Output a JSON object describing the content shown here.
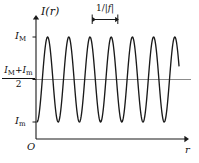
{
  "figure": {
    "axes": {
      "y_label": "I(r)",
      "x_label": "r",
      "origin_label": "O"
    },
    "tick_labels": {
      "max": {
        "symbol": "I",
        "subscript": "M"
      },
      "min": {
        "symbol": "I",
        "subscript": "m"
      },
      "mean": {
        "numerator_first": "I",
        "numerator_first_sub": "M",
        "plus": "+",
        "numerator_second": "I",
        "numerator_second_sub": "m",
        "denominator": "2"
      }
    },
    "period_annotation": {
      "prefix": "1/|",
      "variable": "f",
      "suffix": "|"
    },
    "colors": {
      "curve": "#1a1a1a",
      "axis": "#1a1a1a",
      "midline": "#888888",
      "background": "#ffffff"
    }
  },
  "chart_data": {
    "type": "line",
    "title": "",
    "xlabel": "r",
    "ylabel": "I(r)",
    "grid": false,
    "legend": null,
    "xlim": [
      0,
      199
    ],
    "ylim_pixels": [
      139,
      37
    ],
    "annotations": [
      {
        "text": "1/|f|",
        "kind": "period-bracket",
        "x_start_px": 92,
        "x_end_px": 118
      }
    ],
    "y_reference_lines": [
      {
        "name": "I_M",
        "y_px": 37
      },
      {
        "name": "(I_M+I_m)/2",
        "y_px": 80
      },
      {
        "name": "I_m",
        "y_px": 122
      }
    ],
    "waveform": {
      "form": "sinusoid",
      "amplitude_px": 42.5,
      "midline_px": 79.5,
      "period_px": 21.2,
      "x_start_px": 37,
      "x_end_px": 179,
      "phase_deg": -90,
      "cycles": 6.7,
      "peak_x_px": [
        47.5,
        68.7,
        89.9,
        111.1,
        132.3,
        153.5,
        174.7
      ],
      "trough_x_px": [
        58.1,
        79.3,
        100.5,
        121.7,
        142.9,
        164.1
      ]
    }
  }
}
